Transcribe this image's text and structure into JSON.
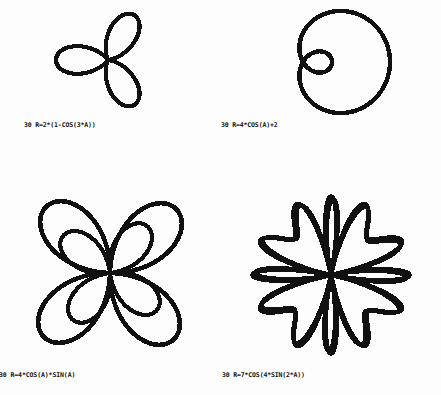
{
  "document": {
    "kind": "polar-curve-plot-sheet",
    "background_color": "#fdfdfd",
    "ink_color": "#111111",
    "figure_count": 4
  },
  "figures": [
    {
      "id": "top-left",
      "caption": "30 R=2*(1-COS(3*A))",
      "line_number": "30",
      "equation": "R=2*(1-COS(3*A))",
      "shape_name": "three-petal-rose",
      "petals": 3
    },
    {
      "id": "top-right",
      "caption": "30 R=4*COS(A)+2",
      "line_number": "30",
      "equation": "R=4*COS(A)+2",
      "shape_name": "limacon-with-inner-loop",
      "petals": 1
    },
    {
      "id": "bottom-left",
      "caption": "30 R=4*COS(A)*SIN(A)",
      "line_number": "30",
      "equation": "R=4*COS(A)*SIN(A)",
      "shape_name": "four-petal-rose-overlapping",
      "petals": 4
    },
    {
      "id": "bottom-right",
      "caption": "30 R=7*COS(4*SIN(2*A))",
      "line_number": "30",
      "equation": "R=7*COS(4*SIN(2*A))",
      "shape_name": "eight-point-star-rose",
      "petals": 8
    }
  ],
  "chart_data": [
    {
      "type": "line",
      "subtype": "polar",
      "title": "30 R=2*(1-COS(3*A))",
      "equation": "r = 2*(1 - cos(3*theta))",
      "xlabel": "",
      "ylabel": "",
      "theta_range_deg": [
        0,
        360
      ],
      "r_max": 4,
      "grid": false,
      "legend": false,
      "lobes": 3,
      "lobe_angles_deg": [
        180,
        60,
        300
      ],
      "series": [
        {
          "name": "R=2*(1-COS(3*A))",
          "param": "A",
          "a": 2,
          "k": 3,
          "form": "a*(1-cos(k*A))"
        }
      ]
    },
    {
      "type": "line",
      "subtype": "polar",
      "title": "30 R=4*COS(A)+2",
      "equation": "r = 4*cos(theta) + 2",
      "xlabel": "",
      "ylabel": "",
      "theta_range_deg": [
        0,
        360
      ],
      "r_max": 6,
      "grid": false,
      "legend": false,
      "lobes": 1,
      "inner_loop": true,
      "series": [
        {
          "name": "R=4*COS(A)+2",
          "param": "A",
          "a": 4,
          "b": 2,
          "form": "a*cos(A)+b"
        }
      ]
    },
    {
      "type": "line",
      "subtype": "polar",
      "title": "30 R=4*COS(A)*SIN(A)",
      "equation": "r = 4*cos(theta)*sin(theta)",
      "xlabel": "",
      "ylabel": "",
      "theta_range_deg": [
        0,
        360
      ],
      "r_max": 2,
      "grid": false,
      "legend": false,
      "lobes": 4,
      "lobe_angles_deg": [
        45,
        135,
        225,
        315
      ],
      "series": [
        {
          "name": "R=4*COS(A)*SIN(A)",
          "param": "A",
          "a": 4,
          "form": "a*cos(A)*sin(A)"
        }
      ]
    },
    {
      "type": "line",
      "subtype": "polar",
      "title": "30 R=7*COS(4*SIN(2*A))",
      "equation": "r = 7*cos(4*sin(2*theta))",
      "xlabel": "",
      "ylabel": "",
      "theta_range_deg": [
        0,
        360
      ],
      "r_max": 7,
      "grid": false,
      "legend": false,
      "lobes": 8,
      "series": [
        {
          "name": "R=7*COS(4*SIN(2*A))",
          "param": "A",
          "a": 7,
          "k": 4,
          "m": 2,
          "form": "a*cos(k*sin(m*A))"
        }
      ]
    }
  ]
}
